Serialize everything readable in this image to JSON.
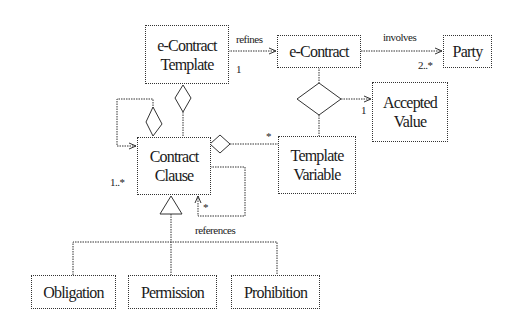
{
  "diagram": {
    "type": "UML class diagram",
    "classes": {
      "econtract_template": {
        "line1": "e-Contract",
        "line2": "Template"
      },
      "econtract": {
        "line1": "e-Contract"
      },
      "party": {
        "line1": "Party"
      },
      "accepted_value": {
        "line1": "Accepted",
        "line2": "Value"
      },
      "contract_clause": {
        "line1": "Contract",
        "line2": "Clause"
      },
      "template_variable": {
        "line1": "Template",
        "line2": "Variable"
      },
      "obligation": {
        "line1": "Obligation"
      },
      "permission": {
        "line1": "Permission"
      },
      "prohibition": {
        "line1": "Prohibition"
      }
    },
    "relations": {
      "refines": {
        "label": "refines",
        "multiplicity": "1"
      },
      "involves": {
        "label": "involves",
        "multiplicity": "2..*"
      },
      "accepted_value": {
        "multiplicity": "1"
      },
      "template_variable": {
        "multiplicity": "*"
      },
      "contract_clause": {
        "multiplicity": "1..*"
      },
      "references": {
        "label": "references",
        "multiplicity": "*"
      }
    },
    "colors": {
      "line": "#333333",
      "background": "#ffffff"
    }
  }
}
